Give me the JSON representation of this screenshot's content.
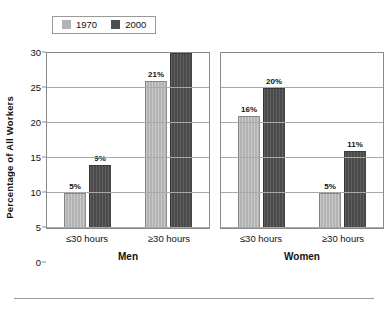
{
  "chart_data": {
    "type": "bar",
    "title": "",
    "subtitle": "",
    "xlabel": "",
    "ylabel": "Percentage of All Workers",
    "ylim": [
      0,
      30
    ],
    "ytick_labels": [
      "0",
      "5",
      "10",
      "15",
      "20",
      "25",
      "30"
    ],
    "ytick_values": [
      0,
      5,
      10,
      15,
      20,
      25,
      30
    ],
    "grid": true,
    "legend_position": "top-left",
    "value_suffix": "%",
    "categories": [
      "≤30 hours",
      "≥30 hours"
    ],
    "legend": [
      {
        "name": "1970",
        "color": "#b3b3b3"
      },
      {
        "name": "2000",
        "color": "#4d4d4d"
      }
    ],
    "panels": [
      {
        "title": "Men",
        "categories": [
          "≤30 hours",
          "≥30 hours"
        ],
        "series": [
          {
            "name": "1970",
            "values": [
              5,
              21
            ],
            "labels": [
              "5%",
              "21%"
            ]
          },
          {
            "name": "2000",
            "values": [
              9,
              27
            ],
            "labels": [
              "9%",
              "27%"
            ]
          }
        ]
      },
      {
        "title": "Women",
        "categories": [
          "≤30 hours",
          "≥30 hours"
        ],
        "series": [
          {
            "name": "1970",
            "values": [
              16,
              5
            ],
            "labels": [
              "16%",
              "5%"
            ]
          },
          {
            "name": "2000",
            "values": [
              20,
              11
            ],
            "labels": [
              "20%",
              "11%"
            ]
          }
        ]
      }
    ]
  },
  "colors": {
    "series_1970": "#b3b3b3",
    "series_2000": "#4d4d4d",
    "axis": "#8a8a8a",
    "gridline": "#a8a8a8",
    "text": "#111111"
  }
}
